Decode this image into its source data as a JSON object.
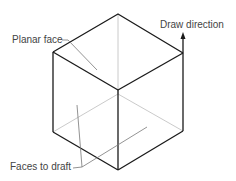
{
  "diagram": {
    "labels": {
      "planar_face": "Planar face",
      "draw_direction": "Draw direction",
      "faces_to_draft": "Faces to draft"
    },
    "colors": {
      "edge": "#1a1a1a",
      "hidden_edge": "#b8b8b8",
      "leader": "#777777",
      "text": "#444444"
    }
  }
}
